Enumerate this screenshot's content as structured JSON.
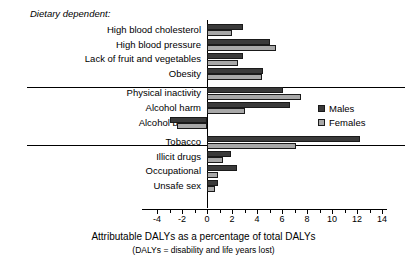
{
  "chart_data": {
    "type": "bar",
    "orientation": "horizontal",
    "title": "",
    "xlabel": "Attributable DALYs as a percentage of total DALYs",
    "xsublabel": "(DALYs = disability and life years lost)",
    "ylabel": "",
    "xlim": [
      -4,
      14
    ],
    "xticks": [
      -4,
      -2,
      0,
      2,
      4,
      6,
      8,
      10,
      12,
      14
    ],
    "xtick_labels": [
      "-4",
      "-2",
      "0",
      "2",
      "4",
      "6",
      "8",
      "10",
      "12",
      "14"
    ],
    "minor_tick_step": 1,
    "grid": false,
    "legend_position": "right-middle",
    "legend": [
      "Males",
      "Females"
    ],
    "group_note": "Dietary dependent:",
    "categories": [
      "High blood cholesterol",
      "High blood pressure",
      "Lack of fruit and vegetables",
      "Obesity",
      "Physical inactivity",
      "Alcohol harm",
      "Alcohol benefit",
      "Tobacco",
      "Illicit drugs",
      "Occupational",
      "Unsafe sex"
    ],
    "groups": [
      {
        "name": "Dietary dependent",
        "categories": [
          "High blood cholesterol",
          "High blood pressure",
          "Lack of fruit and vegetables",
          "Obesity"
        ]
      },
      {
        "name": "",
        "categories": [
          "Physical inactivity",
          "Alcohol harm",
          "Alcohol benefit"
        ]
      },
      {
        "name": "",
        "categories": [
          "Tobacco",
          "Illicit drugs",
          "Occupational",
          "Unsafe sex"
        ]
      }
    ],
    "series": [
      {
        "name": "Males",
        "color": "#3a3a3a",
        "values": [
          2.9,
          5.0,
          2.9,
          4.5,
          6.1,
          6.6,
          -3.0,
          12.2,
          1.9,
          2.4,
          0.9
        ]
      },
      {
        "name": "Females",
        "color": "#a8a8a8",
        "values": [
          2.0,
          5.5,
          2.5,
          4.4,
          7.5,
          3.0,
          -2.4,
          7.1,
          1.3,
          0.85,
          0.6
        ]
      }
    ]
  }
}
